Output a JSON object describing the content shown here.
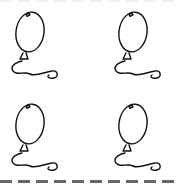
{
  "page": {
    "background": "#ffffff",
    "stroke_color": "#111111",
    "cut_line_color": "#666666"
  },
  "balloons": [
    {
      "row": 1,
      "col": 1,
      "icon": "balloon-icon"
    },
    {
      "row": 1,
      "col": 2,
      "icon": "balloon-icon"
    },
    {
      "row": 2,
      "col": 1,
      "icon": "balloon-icon"
    },
    {
      "row": 2,
      "col": 2,
      "icon": "balloon-icon"
    }
  ],
  "cut_line": {
    "style": "dashed",
    "position": "bottom"
  }
}
